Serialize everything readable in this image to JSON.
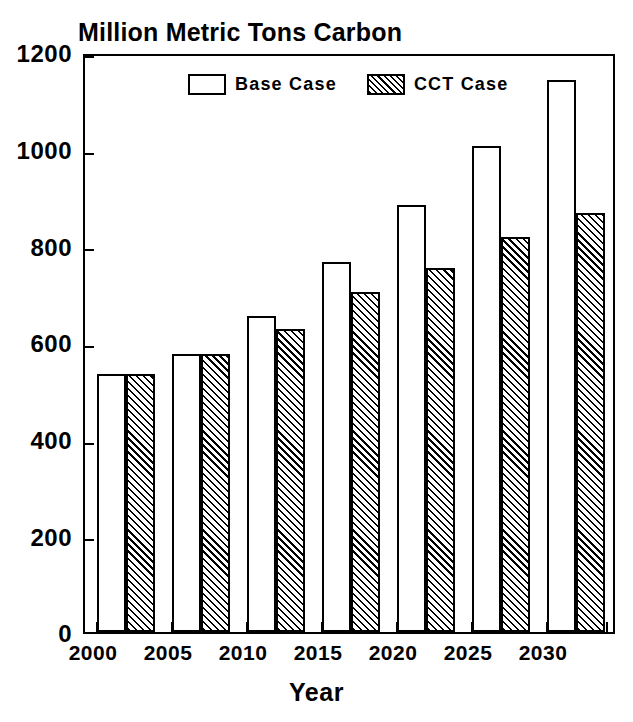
{
  "chart_data": {
    "type": "bar",
    "title": "Million Metric Tons Carbon",
    "xlabel": "Year",
    "ylabel": "",
    "categories": [
      "2000",
      "2005",
      "2010",
      "2015",
      "2020",
      "2025",
      "2030"
    ],
    "series": [
      {
        "name": "Base Case",
        "values": [
          533,
          575,
          653,
          765,
          884,
          1006,
          1142
        ]
      },
      {
        "name": "CCT Case",
        "values": [
          533,
          575,
          626,
          703,
          753,
          817,
          867
        ]
      }
    ],
    "ylim": [
      0,
      1200
    ],
    "yticks": [
      0,
      200,
      400,
      600,
      800,
      1000,
      1200
    ],
    "ytick_labels": [
      "0",
      "200",
      "400",
      "600",
      "800",
      "1000",
      "1200"
    ],
    "grid": false,
    "legend_position": "top-center",
    "colors": {
      "base_fill": "#ffffff",
      "cct_fill": "#ffffff",
      "hatch": "#000000",
      "axis": "#000000",
      "text": "#000000"
    }
  },
  "legend": {
    "items": [
      {
        "label": "Base Case",
        "style": "open"
      },
      {
        "label": "CCT Case",
        "style": "hatched"
      }
    ]
  },
  "axes": {
    "y_labels": [
      "1200",
      "1000",
      "800",
      "600",
      "400",
      "200",
      "0"
    ],
    "x_labels": [
      "2000",
      "2005",
      "2010",
      "2015",
      "2020",
      "2025",
      "2030"
    ],
    "x_title": "Year"
  }
}
